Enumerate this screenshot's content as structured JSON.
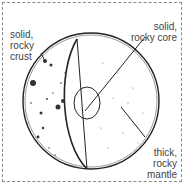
{
  "diagram": {
    "title": "",
    "labels": {
      "crust": "solid,\nrocky\ncrust",
      "core": "solid,\nrocky core",
      "mantle": "thick,\nrocky\nmantle"
    },
    "colors": {
      "line": "#222222",
      "text": "#444444",
      "border": "#888888"
    }
  }
}
